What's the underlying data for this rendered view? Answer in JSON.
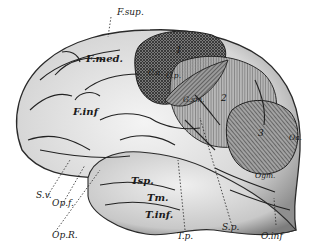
{
  "figure": {
    "region_numbers": [
      "1",
      "2",
      "3"
    ],
    "labels": {
      "f_sup": "F.sup.",
      "f_med": "F.med.",
      "f_inf": "F.inf",
      "c_a": "C.a.",
      "c_p": "C.p.",
      "g_sm": "G.sm.",
      "tsp": "Tsp.",
      "tm": "Tm.",
      "t_inf": "T.inf.",
      "s_v": "S.v.",
      "op_f": "Op.f.",
      "op_r": "Op.R.",
      "t_p": "T.p.",
      "s_p": "S.p.",
      "o_inf": "O.inf",
      "ogm": "Ogm.",
      "oa": "Oa."
    }
  },
  "colors": {
    "background": "#ffffff",
    "ink": "#1a1a1a",
    "cortex_light": "#e6e6e6",
    "cortex_mid": "#bdbdbd",
    "region_dark": "#6f6f6f",
    "region_mid": "#8c8c8c",
    "region_light": "#a8a8a8"
  }
}
